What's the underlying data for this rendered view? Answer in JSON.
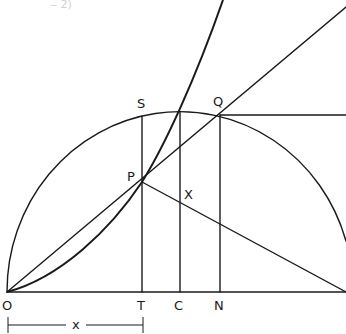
{
  "figure": {
    "top_fragment": "‒ 2)",
    "labels": {
      "O": "O",
      "T": "T",
      "C": "C",
      "N": "N",
      "S": "S",
      "Q": "Q",
      "P": "P",
      "X": "X",
      "x": "x"
    },
    "points": {
      "O": [
        7,
        292
      ],
      "T": [
        142,
        292
      ],
      "C": [
        180,
        292
      ],
      "N": [
        220,
        292
      ],
      "S": [
        142,
        116
      ],
      "Q": [
        220,
        115
      ],
      "P": [
        142,
        182
      ],
      "X": [
        180,
        202
      ]
    },
    "semicircle": {
      "center": "C",
      "through": "O"
    },
    "elements": [
      "baseline OTCN",
      "semicircular arc centered at C",
      "curve from O through P rising steeply",
      "straight line O-P-Q extended",
      "line from P down to right end of baseline",
      "perpendiculars TS, C-top, NQ",
      "horizontal from Q to right",
      "dimension x = OT"
    ],
    "colors": {
      "ink": "#1a1a1a",
      "background": "#ffffff"
    }
  }
}
